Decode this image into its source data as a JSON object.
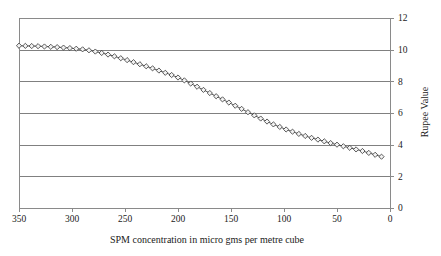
{
  "chart_data": {
    "type": "line",
    "title": "",
    "xlabel": "SPM concentration in micro gms per metre cube",
    "ylabel": "Rupee Value",
    "xlim": [
      350,
      0
    ],
    "ylim": [
      0,
      12
    ],
    "x_reversed": true,
    "grid": "horizontal",
    "legend": "none",
    "marker": "diamond",
    "xticks": [
      350,
      300,
      250,
      200,
      150,
      100,
      50,
      0
    ],
    "xtick_labels": [
      "350",
      "300",
      "250",
      "200",
      "150",
      "100",
      "50",
      "0"
    ],
    "yticks": [
      0,
      2,
      4,
      6,
      8,
      10,
      12
    ],
    "ytick_labels": [
      "0",
      "2",
      "4",
      "6",
      "8",
      "10",
      "12"
    ],
    "y_axis_position": "right",
    "series": [
      {
        "name": "Rupee Value vs SPM",
        "x": [
          350,
          344,
          338,
          332,
          326,
          320,
          314,
          308,
          302,
          296,
          290,
          284,
          278,
          272,
          266,
          260,
          254,
          248,
          242,
          236,
          230,
          224,
          218,
          212,
          206,
          200,
          194,
          188,
          182,
          176,
          170,
          164,
          158,
          152,
          146,
          140,
          134,
          128,
          122,
          116,
          110,
          104,
          98,
          92,
          86,
          80,
          74,
          68,
          62,
          56,
          50,
          44,
          38,
          32,
          26,
          20,
          14,
          8
        ],
        "values": [
          10.25,
          10.24,
          10.23,
          10.22,
          10.2,
          10.18,
          10.16,
          10.13,
          10.1,
          10.06,
          10.02,
          9.96,
          9.88,
          9.79,
          9.69,
          9.58,
          9.46,
          9.34,
          9.21,
          9.08,
          8.95,
          8.82,
          8.68,
          8.54,
          8.4,
          8.24,
          8.06,
          7.86,
          7.66,
          7.46,
          7.26,
          7.06,
          6.86,
          6.66,
          6.46,
          6.26,
          6.05,
          5.85,
          5.65,
          5.46,
          5.28,
          5.12,
          4.96,
          4.82,
          4.68,
          4.55,
          4.43,
          4.32,
          4.21,
          4.1,
          4.0,
          3.9,
          3.8,
          3.7,
          3.6,
          3.48,
          3.36,
          3.24
        ]
      }
    ]
  },
  "colors": {
    "grid": "#808080",
    "axis": "#8a8a8a",
    "line": "#555555",
    "marker_fill": "#f2f2f2",
    "marker_stroke": "#333333",
    "text": "#1a1a1a",
    "background": "#ffffff"
  }
}
